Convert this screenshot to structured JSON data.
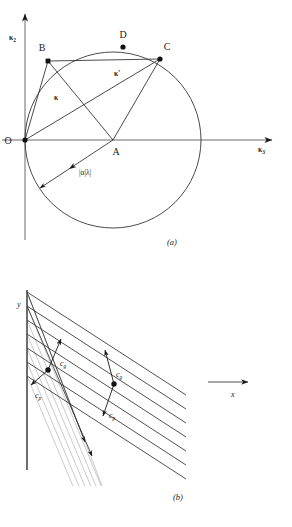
{
  "figure": {
    "panel_a": {
      "caption": "(a)",
      "axes": {
        "y_label": "κ",
        "y_label_sub": "2",
        "x_label": "κ",
        "x_label_sub": "3"
      },
      "points": [
        {
          "id": "O",
          "label": "O",
          "x": 25,
          "y": 140,
          "dot": true
        },
        {
          "id": "A",
          "label": "A",
          "x": 113,
          "y": 140,
          "dot": false
        },
        {
          "id": "B",
          "label": "B",
          "x": 48,
          "y": 61,
          "dot": true
        },
        {
          "id": "C",
          "label": "C",
          "x": 160,
          "y": 59,
          "dot": true
        },
        {
          "id": "D",
          "label": "D",
          "x": 123,
          "y": 47,
          "dot": true
        }
      ],
      "vectors": [
        {
          "id": "kappa",
          "label": "κ",
          "from": "O",
          "to": "B"
        },
        {
          "id": "kappa-prime",
          "label": "κ′",
          "from": "O",
          "to": "C"
        }
      ],
      "magnitude_label": "|α|λ|",
      "circle": {
        "center_x": 113,
        "center_y": 140,
        "radius": 88
      }
    },
    "panel_b": {
      "caption": "(b)",
      "axes": {
        "y_label": "y",
        "x_label": "x"
      },
      "velocity_labels": [
        {
          "id": "cg-left",
          "base": "c",
          "sub": "g",
          "x": 58,
          "y": 365
        },
        {
          "id": "cp-left",
          "base": "c",
          "sub": "p",
          "x": 39,
          "y": 394
        },
        {
          "id": "cg-right",
          "base": "c",
          "sub": "g",
          "x": 119,
          "y": 375
        },
        {
          "id": "cp-right",
          "base": "c",
          "sub": "p",
          "x": 113,
          "y": 412
        }
      ]
    }
  },
  "colors": {
    "ink": "#1a1a1a",
    "line": "#3a3a3a",
    "ray": "#b9b9b9",
    "axis": "#555555"
  }
}
